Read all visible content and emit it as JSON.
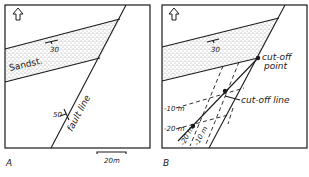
{
  "panels": [
    {
      "id": "A",
      "panel_label": "A",
      "unit_label": "Sandst.",
      "bed_dip": "30",
      "fault_dip": "50",
      "fault_label": "fault line",
      "scale_label": "20m"
    },
    {
      "id": "B",
      "panel_label": "B",
      "bed_dip": "30",
      "cutoff_point_label_1": "cut-off",
      "cutoff_point_label_2": "point",
      "cutoff_line_label": "cut-off line",
      "contours_bed": [
        "-10 m",
        "-20 m"
      ],
      "contours_fault": [
        "-20 m",
        "-10 m"
      ]
    }
  ],
  "icons": {
    "north_arrow": "north-arrow-icon"
  },
  "colors": {
    "ink": "#1a1a1a",
    "paper": "#ffffff"
  }
}
